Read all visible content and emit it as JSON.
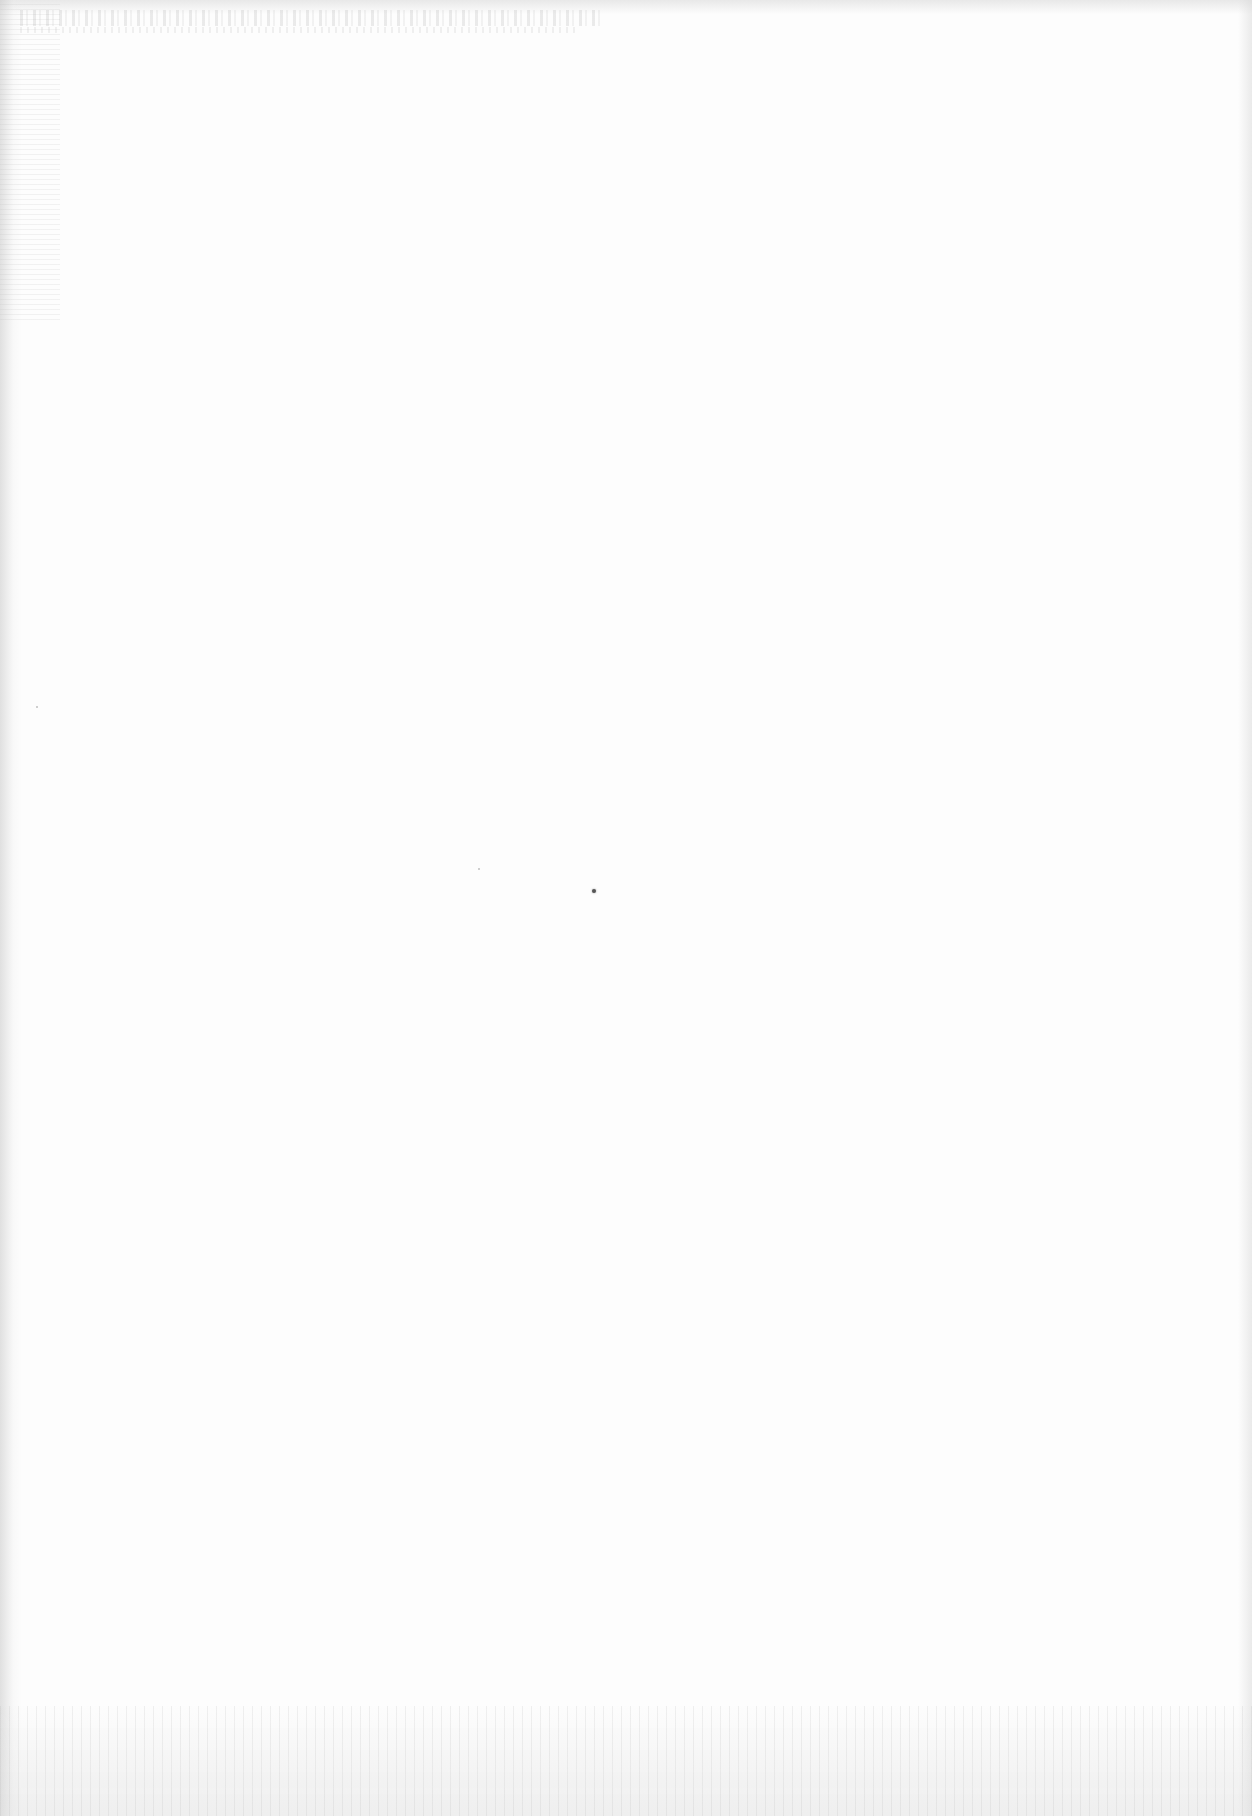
{
  "document": {
    "type": "scanned-page",
    "content": "",
    "legible_text": [],
    "colors": {
      "paper": "#fdfdfd",
      "scan_edge": "#d7d7d7",
      "speck": "#555555"
    }
  }
}
